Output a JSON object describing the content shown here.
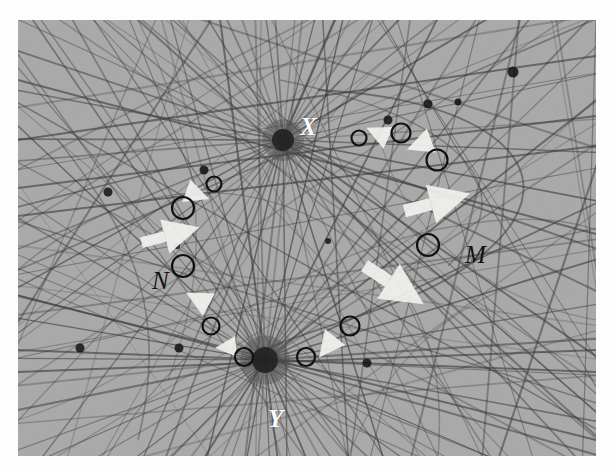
{
  "figure": {
    "kind": "geometric-line-arrangement",
    "background_color": "#a9a9a9",
    "page_color": "#fdfdfd",
    "line_color": "#3a3a3a",
    "marker_color": "#101010",
    "arrow_color": "#f2f2ee",
    "frame": {
      "x": 18,
      "y": 20,
      "width": 578,
      "height": 436
    }
  },
  "labels": [
    {
      "id": "X",
      "text": "X",
      "style": "white",
      "x": 282,
      "y": 94
    },
    {
      "id": "Y",
      "text": "Y",
      "style": "white",
      "x": 250,
      "y": 386
    },
    {
      "id": "M",
      "text": "M",
      "style": "dark",
      "x": 447,
      "y": 222
    },
    {
      "id": "N",
      "text": "N",
      "style": "dark",
      "x": 134,
      "y": 248
    }
  ],
  "hubs": [
    {
      "id": "X",
      "cx": 265,
      "cy": 120,
      "r": 11,
      "rays": 46
    },
    {
      "id": "Y",
      "cx": 247,
      "cy": 340,
      "r": 13,
      "rays": 54
    }
  ],
  "node_dots": [
    {
      "cx": 90,
      "cy": 172,
      "r": 4.5
    },
    {
      "cx": 186,
      "cy": 150,
      "r": 4.5
    },
    {
      "cx": 370,
      "cy": 100,
      "r": 4.5
    },
    {
      "cx": 410,
      "cy": 84,
      "r": 4.5
    },
    {
      "cx": 495,
      "cy": 52,
      "r": 5.5
    },
    {
      "cx": 62,
      "cy": 328,
      "r": 4.5
    },
    {
      "cx": 161,
      "cy": 328,
      "r": 4.5
    },
    {
      "cx": 349,
      "cy": 343,
      "r": 4.5
    },
    {
      "cx": 440,
      "cy": 82,
      "r": 3.5
    },
    {
      "cx": 310,
      "cy": 221,
      "r": 3.0
    },
    {
      "cx": 159,
      "cy": 226,
      "r": 3.0
    }
  ],
  "circle_markers": [
    {
      "id": "c1",
      "cx": 341,
      "cy": 118,
      "r": 7.5
    },
    {
      "id": "c2",
      "cx": 383,
      "cy": 113,
      "r": 9.5
    },
    {
      "id": "c3",
      "cx": 419,
      "cy": 140,
      "r": 10.5
    },
    {
      "id": "c4",
      "cx": 410,
      "cy": 225,
      "r": 11.0,
      "label": "M"
    },
    {
      "id": "c5",
      "cx": 332,
      "cy": 306,
      "r": 9.5
    },
    {
      "id": "c6",
      "cx": 288,
      "cy": 337,
      "r": 9.0
    },
    {
      "id": "c7",
      "cx": 226,
      "cy": 337,
      "r": 9.0
    },
    {
      "id": "c8",
      "cx": 193,
      "cy": 306,
      "r": 8.5
    },
    {
      "id": "c9",
      "cx": 165,
      "cy": 246,
      "r": 11.0,
      "label": "N"
    },
    {
      "id": "c10",
      "cx": 165,
      "cy": 188,
      "r": 11.0
    },
    {
      "id": "c11",
      "cx": 196,
      "cy": 164,
      "r": 7.5
    }
  ],
  "direction_arrows": [
    {
      "id": "a1",
      "cx": 362,
      "cy": 114,
      "angle": 205,
      "size": 15
    },
    {
      "id": "a2",
      "cx": 404,
      "cy": 124,
      "angle": 160,
      "size": 16
    },
    {
      "id": "a3",
      "cx": 428,
      "cy": 180,
      "angle": 345,
      "size": 25
    },
    {
      "id": "a4",
      "cx": 384,
      "cy": 270,
      "angle": 33,
      "size": 26
    },
    {
      "id": "a5",
      "cx": 311,
      "cy": 325,
      "angle": 128,
      "size": 16
    },
    {
      "id": "a6",
      "cx": 210,
      "cy": 327,
      "angle": 175,
      "size": 13
    },
    {
      "id": "a7",
      "cx": 182,
      "cy": 280,
      "angle": 208,
      "size": 16
    },
    {
      "id": "a8",
      "cx": 160,
      "cy": 213,
      "angle": 345,
      "size": 22
    },
    {
      "id": "a9",
      "cx": 177,
      "cy": 174,
      "angle": 20,
      "size": 15
    }
  ],
  "arcs_note": "family of smooth curves crossing the line arrangement, one large arc sweeping the upper-right quadrant"
}
